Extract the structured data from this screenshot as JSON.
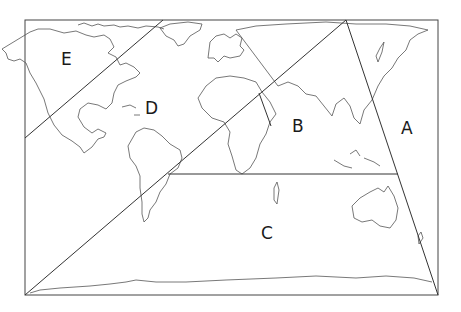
{
  "map": {
    "title": "World map divided into zones",
    "frame": {
      "x": 25,
      "y": 20,
      "width": 413,
      "height": 275
    },
    "line_color": "#333333",
    "zones": [
      {
        "id": "A",
        "label": "A",
        "x": 401,
        "y": 120
      },
      {
        "id": "B",
        "label": "B",
        "x": 292,
        "y": 118
      },
      {
        "id": "C",
        "label": "C",
        "x": 261,
        "y": 225
      },
      {
        "id": "D",
        "label": "D",
        "x": 145,
        "y": 100
      },
      {
        "id": "E",
        "label": "E",
        "x": 61,
        "y": 51
      }
    ]
  }
}
